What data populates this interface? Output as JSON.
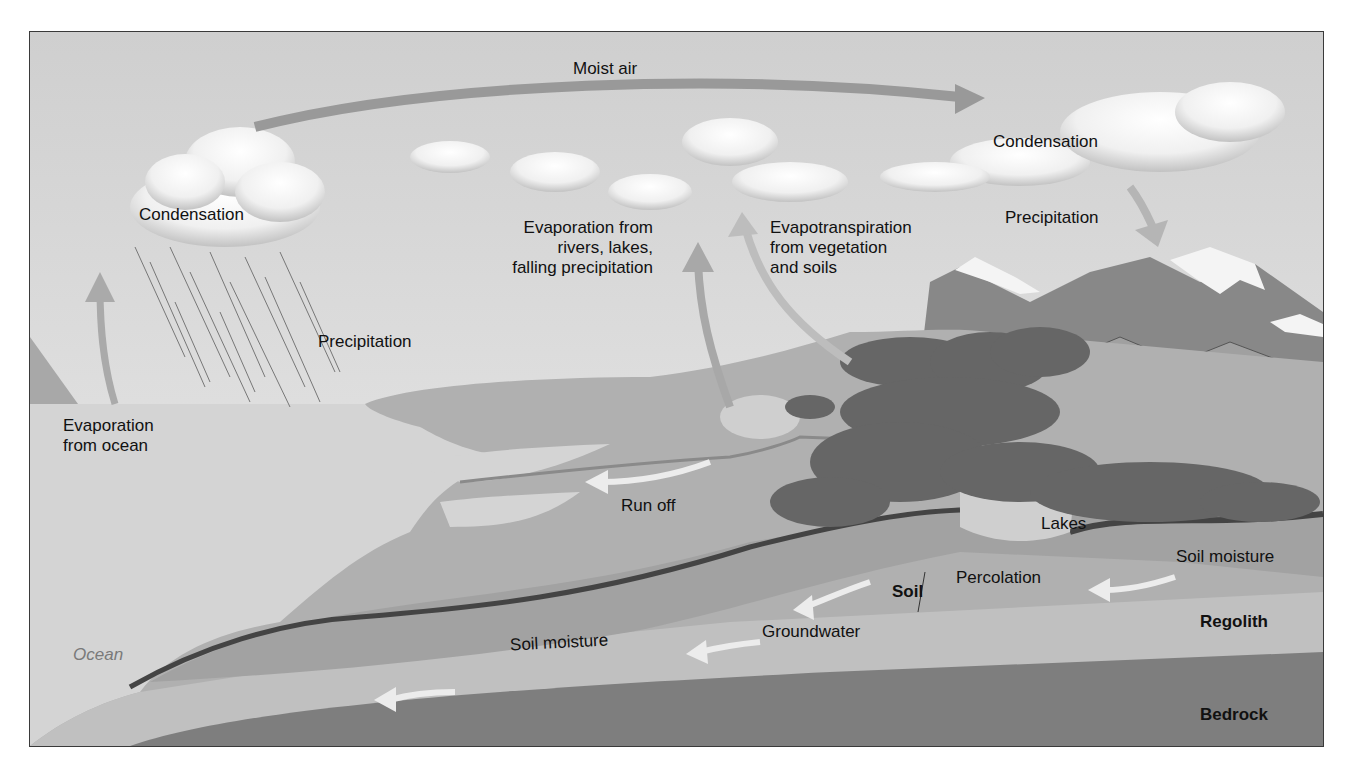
{
  "diagram": {
    "type": "water-cycle",
    "labels": {
      "moist_air": "Moist air",
      "condensation_left": "Condensation",
      "condensation_right": "Condensation",
      "precipitation_left": "Precipitation",
      "precipitation_right": "Precipitation",
      "evaporation_ocean_1": "Evaporation",
      "evaporation_ocean_2": "from ocean",
      "evaporation_rivers_1": "Evaporation from",
      "evaporation_rivers_2": "rivers, lakes,",
      "evaporation_rivers_3": "falling precipitation",
      "evapotranspiration_1": "Evapotranspiration",
      "evapotranspiration_2": "from vegetation",
      "evapotranspiration_3": "and soils",
      "run_off": "Run off",
      "lakes": "Lakes",
      "soil_moisture_right": "Soil moisture",
      "soil_moisture_left": "Soil moisture",
      "percolation": "Percolation",
      "soil": "Soil",
      "groundwater": "Groundwater",
      "regolith": "Regolith",
      "bedrock": "Bedrock",
      "ocean": "Ocean"
    },
    "colors": {
      "sky": "#dedede",
      "ocean": "#d6d6d6",
      "land": "#b2b2b2",
      "mountain": "#8e8e8e",
      "vegetation": "#6a6a6a",
      "soil_band": "#4a4a4a",
      "soil_moisture": "#a3a3a3",
      "regolith": "#bcbcbc",
      "bedrock": "#7f7f7f",
      "arrow_fill": "#b0b0b0",
      "arrow_light": "#ececec",
      "label_text": "#111111"
    }
  }
}
